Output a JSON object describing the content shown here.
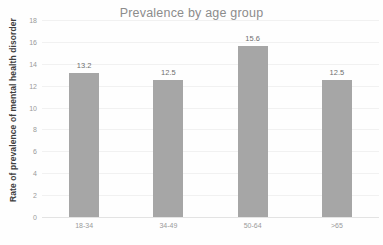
{
  "chart_data": {
    "type": "bar",
    "title": "Prevalence by age group",
    "xlabel": "",
    "ylabel": "Rate of prevalence of mental health disorder",
    "categories": [
      "18-34",
      "34-49",
      "50-64",
      ">65"
    ],
    "values": [
      13.2,
      12.5,
      15.6,
      12.5
    ],
    "data_labels": [
      "13.2",
      "12.5",
      "15.6",
      "12.5"
    ],
    "ylim": [
      0,
      18
    ],
    "ytick_labels": [
      "0",
      "2",
      "4",
      "6",
      "8",
      "10",
      "12",
      "14",
      "16",
      "18"
    ],
    "ytick_values": [
      0,
      2,
      4,
      6,
      8,
      10,
      12,
      14,
      16,
      18
    ],
    "grid": true,
    "legend": false,
    "legend_position": "none",
    "bar_color": "#a6a6a6",
    "gridline_color": "#f1f1f1",
    "title_color": "#8c8c8c",
    "axis_label_color": "#9a9a9a",
    "background_color": "#fefefe"
  }
}
